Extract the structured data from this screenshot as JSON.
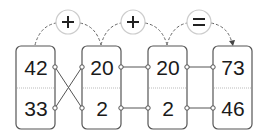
{
  "diagram": {
    "operators": [
      {
        "symbol": "+",
        "name": "plus"
      },
      {
        "symbol": "+",
        "name": "plus"
      },
      {
        "symbol": "=",
        "name": "equals"
      }
    ],
    "boxes": [
      {
        "top": "42",
        "bottom": "33"
      },
      {
        "top": "20",
        "bottom": "2"
      },
      {
        "top": "20",
        "bottom": "2"
      },
      {
        "top": "73",
        "bottom": "46"
      }
    ],
    "connections": [
      {
        "from": "box1.top",
        "to": "box2.bottom",
        "style": "crossed"
      },
      {
        "from": "box1.bottom",
        "to": "box2.top",
        "style": "crossed"
      },
      {
        "from": "box2.top",
        "to": "box3.top",
        "style": "straight"
      },
      {
        "from": "box2.bottom",
        "to": "box3.bottom",
        "style": "straight"
      },
      {
        "from": "box3.top",
        "to": "box4.top",
        "style": "straight"
      },
      {
        "from": "box3.bottom",
        "to": "box4.bottom",
        "style": "straight"
      }
    ],
    "colors": {
      "box_border": "#555555",
      "text": "#1a1a1a",
      "operator_circle": "#cccccc",
      "connector": "#555555",
      "divider": "#bbbbbb"
    }
  }
}
